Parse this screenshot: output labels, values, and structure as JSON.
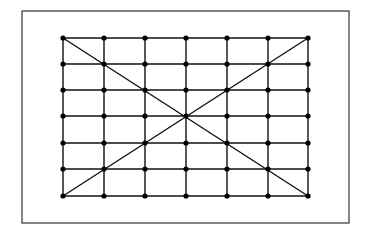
{
  "diagram": {
    "colors": {
      "background": "#ffffff",
      "line": "#111111",
      "frame": "#333333",
      "dot": "#000000"
    },
    "frame": {
      "x": 22,
      "y": 11,
      "width": 327,
      "height": 212
    },
    "grid": {
      "columns_x": [
        63,
        104,
        145,
        186,
        227,
        268,
        308
      ],
      "rows_y": [
        38,
        64,
        90,
        116,
        143,
        169,
        196
      ],
      "dot_radius": 2.6,
      "line_width": 1.4
    },
    "diagonals": [
      {
        "from": [
          63,
          38
        ],
        "to": [
          308,
          196
        ]
      },
      {
        "from": [
          308,
          38
        ],
        "to": [
          63,
          196
        ]
      }
    ]
  }
}
